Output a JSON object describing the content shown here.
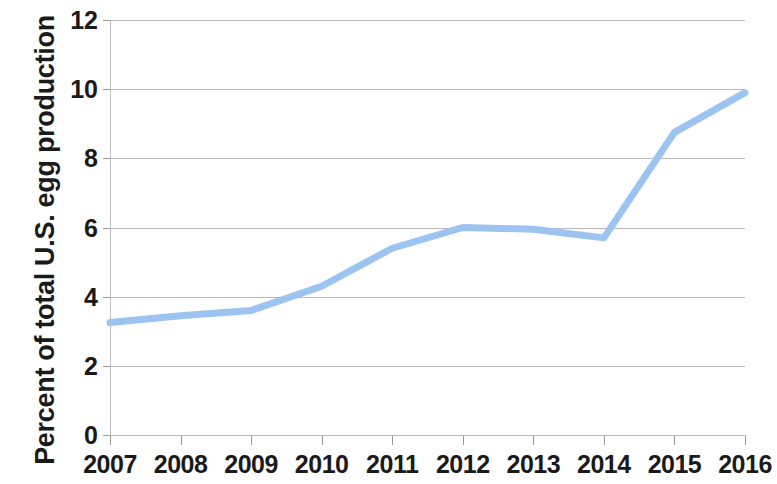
{
  "chart_data": {
    "type": "line",
    "title": "",
    "xlabel": "",
    "ylabel": "Percent of total U.S. egg production",
    "categories": [
      "2007",
      "2008",
      "2009",
      "2010",
      "2011",
      "2012",
      "2013",
      "2014",
      "2015",
      "2016"
    ],
    "x": [
      2007,
      2008,
      2009,
      2010,
      2011,
      2012,
      2013,
      2014,
      2015,
      2016
    ],
    "values": [
      3.25,
      3.45,
      3.6,
      4.3,
      5.4,
      6.0,
      5.95,
      5.7,
      8.75,
      9.9
    ],
    "series": [
      {
        "name": "Percent of total U.S. egg production",
        "values": [
          3.25,
          3.45,
          3.6,
          4.3,
          5.4,
          6.0,
          5.95,
          5.7,
          8.75,
          9.9
        ],
        "color": "#9DC3F0"
      }
    ],
    "ylim": [
      0,
      12
    ],
    "yticks": [
      0,
      2,
      4,
      6,
      8,
      10,
      12
    ],
    "ytick_labels": [
      "0",
      "2",
      "4",
      "6",
      "8",
      "10",
      "12"
    ],
    "xlim": [
      2007,
      2016
    ],
    "grid": true,
    "grid_axis": "y",
    "grid_color": "#b9b9b9",
    "legend": false,
    "legend_position": "none",
    "line_width": 7,
    "markers": false,
    "background": "#ffffff",
    "axis_color": "#b9b9b9",
    "text_color": "#1a1a1a"
  }
}
